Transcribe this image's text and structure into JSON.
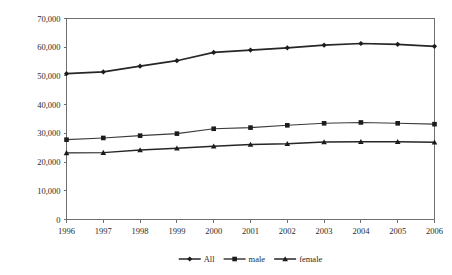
{
  "chart_data": {
    "type": "line",
    "title": "",
    "subtitle": "",
    "xlabel": "",
    "ylabel": "",
    "grid": false,
    "legend_position": "bottom",
    "categories": [
      "1996",
      "1997",
      "1998",
      "1999",
      "2000",
      "2001",
      "2002",
      "2003",
      "2004",
      "2005",
      "2006"
    ],
    "x": [
      1996,
      1997,
      1998,
      1999,
      2000,
      2001,
      2002,
      2003,
      2004,
      2005,
      2006
    ],
    "xlim": [
      1996,
      2006
    ],
    "ylim": [
      0,
      70000
    ],
    "ytick_values": [
      0,
      10000,
      20000,
      30000,
      40000,
      50000,
      60000,
      70000
    ],
    "ytick_labels": [
      "0",
      "10,000",
      "20,000",
      "30,000",
      "40,000",
      "50,000",
      "60,000",
      "70,000"
    ],
    "series": [
      {
        "name": "All",
        "marker": "diamond",
        "color": "#262626",
        "values": [
          50800,
          51400,
          53400,
          55300,
          58200,
          59000,
          59800,
          60700,
          61300,
          61000,
          60300
        ]
      },
      {
        "name": "male",
        "marker": "square",
        "color": "#3b3b3b",
        "values": [
          27800,
          28400,
          29200,
          29900,
          31600,
          32000,
          32800,
          33500,
          33800,
          33500,
          33200
        ]
      },
      {
        "name": "female",
        "marker": "triangle",
        "color": "#262626",
        "values": [
          23200,
          23300,
          24200,
          24800,
          25500,
          26100,
          26400,
          27000,
          27100,
          27100,
          26900
        ]
      }
    ]
  },
  "legend": {
    "items": [
      {
        "label": "All",
        "marker": "diamond"
      },
      {
        "label": "male",
        "marker": "square"
      },
      {
        "label": "female",
        "marker": "triangle"
      }
    ]
  }
}
